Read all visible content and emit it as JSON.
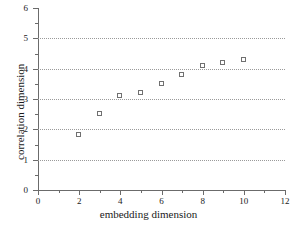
{
  "chart_data": {
    "type": "scatter",
    "title": "",
    "xlabel": "embedding dimension",
    "ylabel": "correlation dimension",
    "xlim": [
      0,
      12
    ],
    "ylim": [
      0,
      6
    ],
    "xticks": [
      0,
      2,
      4,
      6,
      8,
      10,
      12
    ],
    "yticks": [
      0,
      1,
      2,
      3,
      4,
      5,
      6
    ],
    "xtick_labels": [
      "0",
      "2",
      "4",
      "6",
      "8",
      "10",
      "12"
    ],
    "ytick_labels": [
      "0",
      "1",
      "2",
      "3",
      "4",
      "5",
      "6"
    ],
    "x_minor_ticks": [
      1,
      3,
      5,
      7,
      9,
      11
    ],
    "y_minor_ticks": [
      0.5,
      1.5,
      2.5,
      3.5,
      4.5,
      5.5
    ],
    "grid": true,
    "grid_axis": "y",
    "gridline_values": [
      1,
      2,
      3,
      4,
      5
    ],
    "grid_style": "dotted",
    "legend": null,
    "marker": "open-square",
    "marker_color": "#707070",
    "x": [
      2,
      3,
      4,
      5,
      6,
      7,
      8,
      9,
      10
    ],
    "values": [
      1.8,
      2.5,
      3.1,
      3.2,
      3.5,
      3.8,
      4.1,
      4.2,
      4.3
    ],
    "points": [
      {
        "x": 2,
        "y": 1.8
      },
      {
        "x": 3,
        "y": 2.5
      },
      {
        "x": 4,
        "y": 3.1
      },
      {
        "x": 5,
        "y": 3.2
      },
      {
        "x": 6,
        "y": 3.5
      },
      {
        "x": 7,
        "y": 3.8
      },
      {
        "x": 8,
        "y": 4.1
      },
      {
        "x": 9,
        "y": 4.2
      },
      {
        "x": 10,
        "y": 4.3
      }
    ]
  },
  "colors": {
    "axis": "#6b6b6b",
    "grid": "#9a9a9a",
    "marker_outline": "#707070",
    "background": "#ffffff",
    "text": "#1a1a1a"
  }
}
